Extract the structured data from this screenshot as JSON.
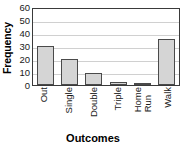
{
  "chart_data": {
    "type": "bar",
    "title": "",
    "xlabel": "Outcomes",
    "ylabel": "Frequency",
    "categories": [
      "Out",
      "Single",
      "Double",
      "Triple",
      "Home Run",
      "Walk"
    ],
    "category_lines": [
      [
        "Out"
      ],
      [
        "Single"
      ],
      [
        "Double"
      ],
      [
        "Triple"
      ],
      [
        "Home",
        "Run"
      ],
      [
        "Walk"
      ]
    ],
    "values": [
      30,
      20,
      9,
      2.5,
      1,
      35.5
    ],
    "ylim": [
      0,
      60
    ],
    "ytick_labels": [
      "0",
      "10",
      "20",
      "30",
      "40",
      "50",
      "60"
    ],
    "ytick_values": [
      0,
      10,
      20,
      30,
      40,
      50,
      60
    ],
    "grid": true,
    "grid_axis": "y",
    "legend": false,
    "bar_fill_color": "#d5d5d5",
    "bar_border_color": "#4a4a4a",
    "gridline_color": "#d0d0d0",
    "frame_color": "#3a3a3a",
    "background_color": "#ffffff",
    "text_color": "#1a1a1a"
  }
}
